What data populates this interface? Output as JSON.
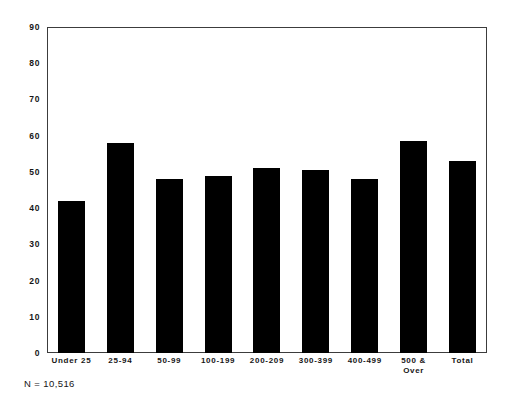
{
  "chart_data": {
    "type": "bar",
    "title": "",
    "subtitle": "",
    "xlabel": "",
    "ylabel": "",
    "categories": [
      "Under 25",
      "25-94",
      "50-99",
      "100-199",
      "200-209",
      "300-399",
      "400-499",
      "500 &\nOver",
      "Total"
    ],
    "values": [
      42,
      58,
      48,
      49,
      51,
      50.5,
      48,
      58.5,
      53
    ],
    "ylim": [
      0,
      90
    ],
    "ytick_step": 10,
    "yticks": [
      0,
      10,
      20,
      30,
      40,
      50,
      60,
      70,
      80,
      90
    ],
    "ytick_labels": [
      "0",
      "10",
      "20",
      "30",
      "40",
      "50",
      "60",
      "70",
      "80",
      "90"
    ],
    "grid": false,
    "legend": null,
    "bar_color": "#000000",
    "annotations": [
      "N = 10,516"
    ]
  },
  "figure": {
    "footnote": "N = 10,516",
    "frame_color": "#3c3c3c",
    "background": "#ffffff"
  },
  "x_labels": [
    {
      "line1": "Under 25",
      "line2": ""
    },
    {
      "line1": "25-94",
      "line2": ""
    },
    {
      "line1": "50-99",
      "line2": ""
    },
    {
      "line1": "100-199",
      "line2": ""
    },
    {
      "line1": "200-209",
      "line2": ""
    },
    {
      "line1": "300-399",
      "line2": ""
    },
    {
      "line1": "400-499",
      "line2": ""
    },
    {
      "line1": "500 &",
      "line2": "Over"
    },
    {
      "line1": "Total",
      "line2": ""
    }
  ]
}
